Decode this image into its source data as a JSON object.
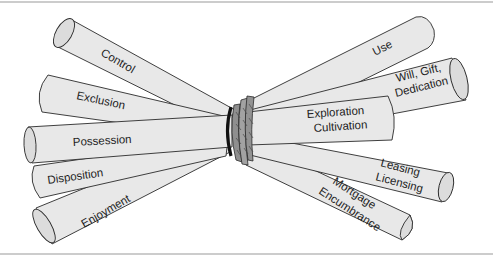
{
  "diagram": {
    "title": "",
    "colors": {
      "stick_fill": "#e8e8e8",
      "stick_outline": "#2a2a2a",
      "knot": "#8a8a8a",
      "knot_dark": "#111111",
      "rule": "#9a9a9a"
    },
    "left_sticks": [
      {
        "id": "control",
        "lines": [
          "Control"
        ]
      },
      {
        "id": "exclusion",
        "lines": [
          "Exclusion"
        ]
      },
      {
        "id": "possession",
        "lines": [
          "Possession"
        ]
      },
      {
        "id": "disposition",
        "lines": [
          "Disposition"
        ]
      },
      {
        "id": "enjoyment",
        "lines": [
          "Enjoyment"
        ]
      }
    ],
    "right_sticks": [
      {
        "id": "use",
        "lines": [
          "Use"
        ]
      },
      {
        "id": "will-gift-dedication",
        "lines": [
          "Will, Gift,",
          "Dedication"
        ]
      },
      {
        "id": "exploration-cultivation",
        "lines": [
          "Exploration",
          "Cultivation"
        ]
      },
      {
        "id": "leasing-licensing",
        "lines": [
          "Leasing",
          "Licensing"
        ]
      },
      {
        "id": "mortgage-encumbrance",
        "lines": [
          "Mortgage",
          "Encumbrance"
        ]
      }
    ],
    "knot": {
      "label": "binding-rope"
    }
  }
}
